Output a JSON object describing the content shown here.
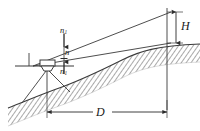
{
  "figure": {
    "labels": {
      "height_symbol": "H",
      "distance_symbol": "D",
      "stadia_upper": "n",
      "stadia_upper_sub": "1",
      "stadia_middle": "n",
      "stadia_middle_sub": "",
      "stadia_lower": "n",
      "stadia_lower_sub": "1"
    },
    "colors": {
      "line": "#3a3a3a",
      "hatch": "#555555",
      "background": "#ffffff",
      "text": "#1a1a1a"
    },
    "geometry": {
      "instrument_station_x": 47,
      "instrument_station_y": 66,
      "staff_x": 167,
      "dimension_line_y": 112,
      "dimension_left_x": 47,
      "dimension_right_x": 167,
      "height_arrow_top_y": 12,
      "height_arrow_bottom_y": 43,
      "sight_upper_end_y": 12,
      "sight_lower_end_y": 43
    }
  }
}
